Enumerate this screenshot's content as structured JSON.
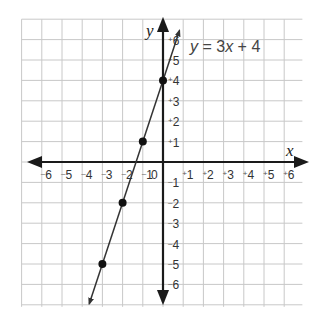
{
  "chart_data": {
    "type": "line",
    "title": "y = 3x + 4",
    "equation": {
      "y": "y",
      "eq": " = 3",
      "x": "x",
      "rest": " + 4"
    },
    "xlabel": "x",
    "ylabel": "y",
    "xlim": [
      -6,
      6
    ],
    "ylim": [
      -6,
      6
    ],
    "grid": true,
    "x_ticks": [
      "-6",
      "-5",
      "-4",
      "-3",
      "-2",
      "-1",
      "0",
      "+1",
      "+2",
      "+3",
      "+4",
      "+5",
      "+6"
    ],
    "y_ticks": [
      "+6",
      "+5",
      "+4",
      "+3",
      "+2",
      "+1",
      "-1",
      "-2",
      "-3",
      "-4",
      "-5",
      "-6"
    ],
    "series": [
      {
        "name": "y = 3x + 4",
        "slope": 3,
        "intercept": 4,
        "points": [
          {
            "x": -3,
            "y": -5
          },
          {
            "x": -2,
            "y": -2
          },
          {
            "x": -1,
            "y": 1
          },
          {
            "x": 0,
            "y": 4
          }
        ]
      }
    ],
    "colors": {
      "grid": "#c8c8c8",
      "axis": "#1a1a1a",
      "line": "#333333",
      "point": "#111111"
    }
  }
}
